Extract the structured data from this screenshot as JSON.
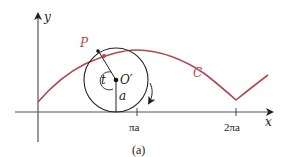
{
  "figure": {
    "caption": "(a)",
    "axes": {
      "x_label": "x",
      "y_label": "y",
      "x_ticks": [
        {
          "label": "πa",
          "value": "pi*a"
        },
        {
          "label": "2πa",
          "value": "2*pi*a"
        }
      ]
    },
    "circle": {
      "center_label": "O′",
      "radius_label": "a",
      "angle_label": "t",
      "rotation": "clockwise"
    },
    "point_label": "P",
    "curve_label": "C",
    "colors": {
      "curve": "#b5474f",
      "lines": "#222222",
      "background": "#ffffff"
    }
  }
}
